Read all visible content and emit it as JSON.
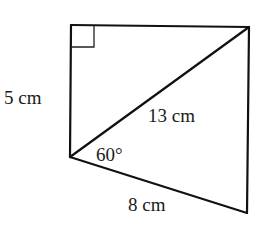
{
  "figure": {
    "vertices": {
      "top_left": [
        71,
        25
      ],
      "top_right": [
        249,
        27
      ],
      "bottom_left": [
        70,
        157
      ],
      "bottom_right": [
        247,
        213
      ]
    },
    "right_angle_marker": {
      "corner": "top_left",
      "size": 22
    },
    "labels": {
      "left_side": "5 cm",
      "diagonal": "13 cm",
      "angle": "60°",
      "bottom_side": "8 cm"
    },
    "colors": {
      "line": "#111111",
      "text": "#1a1a1a",
      "background": "#ffffff"
    }
  }
}
